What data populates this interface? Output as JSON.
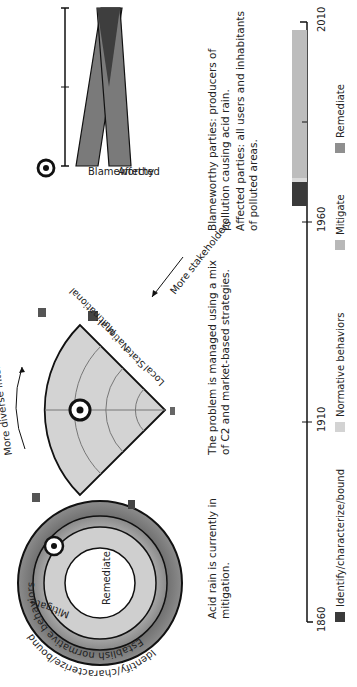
{
  "panels": {
    "phase": {
      "rings": [
        {
          "label": "Identify/characterize/bound",
          "color": "#7a7a7a"
        },
        {
          "label": "Establish normative behaviors",
          "color": "#a9a9a9"
        },
        {
          "label": "Mitigate",
          "color": "#cfcfcf"
        },
        {
          "label": "Remediate",
          "color": "#ffffff"
        }
      ],
      "marker": "target-icon",
      "caption": [
        "Acid rain is currently in",
        "mitigation."
      ]
    },
    "scale": {
      "levels": [
        "Local",
        "State",
        "National",
        "Multinational"
      ],
      "arrow_interests": "More diverse interests",
      "arrow_stakeholders": "More stakeholders",
      "marker": "target-icon",
      "caption": [
        "The problem is managed using a mix",
        "of C2 and market-based strategies."
      ]
    },
    "parties": {
      "labels": [
        "Blameworthy",
        "Affected"
      ],
      "marker": "target-icon",
      "caption1": [
        "Blameworthy parties: producers of",
        "pollution causing acid rain."
      ],
      "caption2": [
        "Affected parties: all users and inhabitants",
        "of polluted areas."
      ]
    }
  },
  "timeline": {
    "ticks": [
      "1860",
      "1910",
      "1960",
      "2010"
    ],
    "segments": [
      {
        "phase": "Identify/characterize/bound",
        "start": 1964,
        "end": 1970,
        "color": "#3a3a3a"
      },
      {
        "phase": "Normative behaviors",
        "start": 1970,
        "end": 1971,
        "color": "#d9d9d9"
      },
      {
        "phase": "Mitigate",
        "start": 1971,
        "end": 2008,
        "color": "#bdbdbd"
      }
    ],
    "legend": [
      {
        "label": "Identify/characterize/bound",
        "color": "#3a3a3a"
      },
      {
        "label": "Normative behaviors",
        "color": "#d3d3d3"
      },
      {
        "label": "Mitigate",
        "color": "#b8b8b8"
      },
      {
        "label": "Remediate",
        "color": "#8f8f8f"
      }
    ]
  }
}
